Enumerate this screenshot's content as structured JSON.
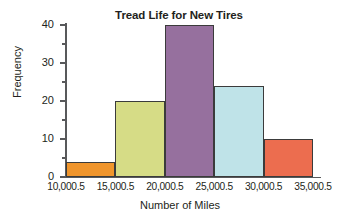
{
  "chart_data": {
    "type": "bar",
    "title": "Tread Life for New Tires",
    "xlabel": "Number of Miles",
    "ylabel": "Frequency",
    "bin_edges": [
      "10,000.5",
      "15,000.5",
      "20,000.5",
      "25,000.5",
      "30,000.5",
      "35,000.5"
    ],
    "categories": [
      "10,000.5-15,000.5",
      "15,000.5-20,000.5",
      "20,000.5-25,000.5",
      "25,000.5-30,000.5",
      "30,000.5-35,000.5"
    ],
    "values": [
      4,
      20,
      40,
      24,
      10
    ],
    "bar_colors": [
      "#F0952C",
      "#D6DC86",
      "#96709E",
      "#BFE3E8",
      "#EC6D4F"
    ],
    "bar_outline": "#3b3b3b",
    "ylim": [
      0,
      40
    ],
    "ytick_values": [
      0,
      10,
      20,
      30,
      40
    ],
    "ytick_labels": [
      "0",
      "10",
      "20",
      "30",
      "40"
    ],
    "yminor_values": [
      5,
      15,
      25,
      35
    ],
    "grid": false,
    "legend": "none",
    "axis_color": "#58595b"
  }
}
